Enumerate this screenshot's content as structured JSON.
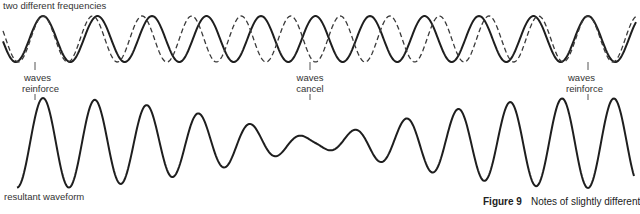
{
  "figure": {
    "title_label": "two different frequencies",
    "resultant_label": "resultant waveform",
    "caption_number": "Figure 9",
    "caption_text": "Notes of slightly different",
    "annotations": [
      {
        "line1": "waves",
        "line2": "reinforce",
        "x": 35
      },
      {
        "line1": "waves",
        "line2": "cancel",
        "x": 310
      },
      {
        "line1": "waves",
        "line2": "reinforce",
        "x": 588
      }
    ]
  },
  "chart_data": {
    "type": "line",
    "title": "two different frequencies",
    "series": [
      {
        "name": "wave A (solid)",
        "style": "solid",
        "center_y": 39,
        "amplitude": 23,
        "period": 54.5,
        "phase_peak_x": 43,
        "x_start": 3,
        "x_end": 636
      },
      {
        "name": "wave B (dashed)",
        "style": "dashed",
        "center_y": 39,
        "amplitude": 23,
        "period": 49.55,
        "phase_peak_x": 43,
        "x_start": 3,
        "x_end": 636
      },
      {
        "name": "resultant waveform",
        "style": "solid",
        "center_y": 143,
        "max_amplitude": 45,
        "min_amplitude": 4,
        "period": 51.9,
        "phase_peak_x": 43,
        "beat_reinforce_x": [
          43,
          588
        ],
        "beat_cancel_x": 315,
        "x_start": 17,
        "x_end": 634
      }
    ],
    "annotations": [
      "waves reinforce",
      "waves cancel",
      "waves reinforce"
    ],
    "caption": "Figure 9 Notes of slightly different"
  }
}
